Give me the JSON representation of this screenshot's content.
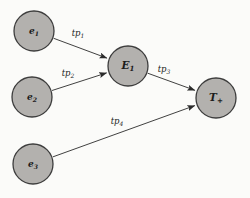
{
  "diagram": {
    "colors": {
      "background": "#fbfbf9",
      "node_fill": "#b3b1ae",
      "node_stroke": "#3d3d3d",
      "edge": "#2b2b2b",
      "text": "#1c1c1c"
    },
    "nodes": [
      {
        "id": "e1",
        "label": "e",
        "sub": "1",
        "x": 34,
        "y": 31,
        "r": 20,
        "font_size": 9
      },
      {
        "id": "e2",
        "label": "e",
        "sub": "2",
        "x": 32,
        "y": 97,
        "r": 20,
        "font_size": 9
      },
      {
        "id": "e3",
        "label": "e",
        "sub": "3",
        "x": 33,
        "y": 164,
        "r": 20,
        "font_size": 9
      },
      {
        "id": "E1",
        "label": "E",
        "sub": "1",
        "x": 128,
        "y": 66,
        "r": 20,
        "font_size": 10.5
      },
      {
        "id": "Tplus",
        "label": "T",
        "sub": "+",
        "x": 216,
        "y": 98,
        "r": 20,
        "font_size": 10.5
      }
    ],
    "edges": [
      {
        "id": "tp1",
        "from": "e1",
        "to": "E1",
        "label": "tp",
        "sub": "1",
        "label_x": 78,
        "label_y": 36
      },
      {
        "id": "tp2",
        "from": "e2",
        "to": "E1",
        "label": "tp",
        "sub": "2",
        "label_x": 68,
        "label_y": 76
      },
      {
        "id": "tp3",
        "from": "E1",
        "to": "Tplus",
        "label": "tp",
        "sub": "3",
        "label_x": 164,
        "label_y": 72
      },
      {
        "id": "tp4",
        "from": "e3",
        "to": "Tplus",
        "label": "tp",
        "sub": "4",
        "label_x": 117,
        "label_y": 124
      }
    ]
  }
}
